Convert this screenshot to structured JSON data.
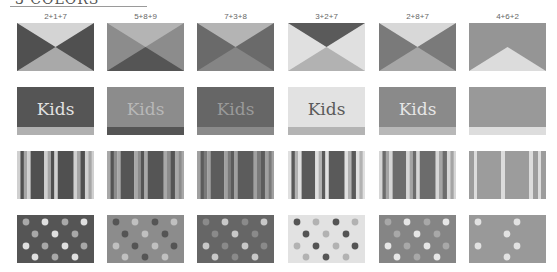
{
  "header": {
    "title": "3 COLORS"
  },
  "palette": {
    "1": "#d2d2d2",
    "2": "#505050",
    "3": "#a8a8a8",
    "4": "#8a8a8a",
    "5": "#9c9c9c",
    "6": "#e0e0e0",
    "7": "#b0b0b0",
    "8": "#6a6a6a",
    "9": "#4a4a4a"
  },
  "columns": [
    {
      "label": "2+1+7",
      "codes": [
        "2",
        "1",
        "7"
      ]
    },
    {
      "label": "5+8+9",
      "codes": [
        "5",
        "8",
        "9"
      ]
    },
    {
      "label": "7+3+8",
      "codes": [
        "7",
        "3",
        "8"
      ]
    },
    {
      "label": "3+2+7",
      "codes": [
        "3",
        "2",
        "7"
      ]
    },
    {
      "label": "2+8+7",
      "codes": [
        "2",
        "8",
        "7"
      ]
    },
    {
      "label": "4+6+2",
      "codes": [
        "4",
        "6",
        "2"
      ]
    }
  ],
  "swatches": {
    "kids_text": "Kids"
  },
  "rows": [
    "triangles",
    "kids-banner",
    "stripes",
    "dots"
  ]
}
